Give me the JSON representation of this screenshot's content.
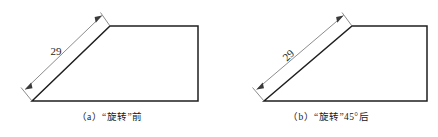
{
  "document": {
    "title": "“旋转”前后对比图",
    "background_color": "#ffffff",
    "line_color": "#1f1f1f",
    "dimension_line_color": "#6e6e6e",
    "text_color": "#171717"
  },
  "figures": [
    {
      "id": "a",
      "caption_index": "（a）",
      "caption_text": "“旋转”前",
      "caption_full": "（a）“旋转”前",
      "dimension_label": "29",
      "dimension_label_rotation_deg": 0,
      "shape": {
        "type": "polygon",
        "description": "right-trapezoid-with-slanted-left-edge",
        "points": "32,101 110,26 198,26 198,101"
      },
      "dimension": {
        "extension_line_1": "32,101 22,88",
        "extension_line_2": "110,26 101,13",
        "measure_line": "24,90 103,15",
        "arrow_start": "24,90",
        "arrow_end": "103,15"
      }
    },
    {
      "id": "b",
      "caption_index": "（b）",
      "caption_text": "“旋转”45°后",
      "caption_angle": "45°",
      "caption_full": "（b）“旋转”45°后",
      "dimension_label": "29",
      "dimension_label_rotation_deg": -44,
      "shape": {
        "type": "polygon",
        "description": "right-trapezoid-with-slanted-left-edge",
        "points": "45,101 133,26 208,26 208,101"
      },
      "dimension": {
        "extension_line_1": "45,101 34,88",
        "extension_line_2": "133,26 123,13",
        "measure_line": "37,90 125,15",
        "arrow_start": "37,90",
        "arrow_end": "125,15"
      }
    }
  ]
}
